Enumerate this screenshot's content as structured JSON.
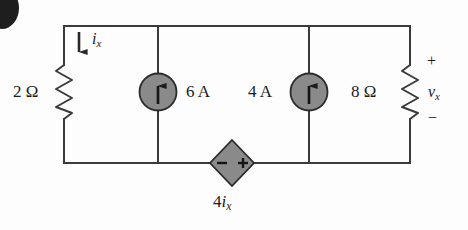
{
  "figure": {
    "type": "electrical-circuit-schematic",
    "background_color": "#fdfdfd",
    "wire_color": "#3a3a3a",
    "element_fill_color": "#8a8a8a"
  },
  "scan_artifact": {
    "name": "page-edge-blob",
    "color": "#1e1e1e"
  },
  "components": {
    "resistor_left": {
      "label": "2 Ω",
      "value": "2",
      "unit": "Ω",
      "kind": "resistor",
      "position": "left-branch"
    },
    "resistor_right": {
      "label": "8 Ω",
      "value": "8",
      "unit": "Ω",
      "kind": "resistor",
      "position": "right-branch"
    },
    "current_source_1": {
      "label": "6 A",
      "value": "6",
      "unit": "A",
      "kind": "independent-current-source",
      "arrow_direction": "up"
    },
    "current_source_2": {
      "label": "4 A",
      "value": "4",
      "unit": "A",
      "kind": "independent-current-source",
      "arrow_direction": "up"
    },
    "dependent_source": {
      "label_prefix": "4",
      "label_var": "i",
      "label_sub": "x",
      "kind": "dependent-voltage-source",
      "shape": "diamond",
      "terminal_left": "−",
      "terminal_right": "+"
    }
  },
  "annotations": {
    "current_ix": {
      "var": "i",
      "sub": "x",
      "arrow_direction": "down",
      "branch": "left-branch"
    },
    "voltage_vx": {
      "var": "v",
      "sub": "x",
      "polarity_top": "+",
      "polarity_bottom": "−",
      "across": "resistor_right"
    }
  }
}
